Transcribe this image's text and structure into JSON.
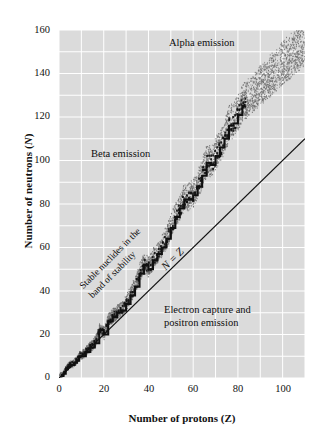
{
  "figure": {
    "background_color": "#ffffff",
    "plot_background_color": "#dbdbdb",
    "gridline_color": "#ffffff",
    "axis_color": "#111111",
    "stable_line_color": "#111111",
    "nz_line_color": "#111111",
    "band_stipple_color": "#6b6b6b"
  },
  "axes": {
    "x_title": "Number of protons (Z)",
    "y_title_prefix": "Number of neutrons (",
    "y_title_symbol": "N",
    "y_title_suffix": ")",
    "x_ticks": [
      "0",
      "20",
      "40",
      "60",
      "80",
      "100"
    ],
    "y_ticks": [
      "0",
      "20",
      "40",
      "60",
      "80",
      "100",
      "120",
      "140",
      "160"
    ]
  },
  "annotations": {
    "alpha": "Alpha emission",
    "beta": "Beta emission",
    "electron_capture_line1": "Electron capture and",
    "electron_capture_line2": "positron emission",
    "stable_line1": "Stable nuclides in the",
    "stable_line2": "band of stability",
    "nz_line": "N = Z"
  },
  "chart_data": {
    "type": "scatter",
    "title": "",
    "xlabel": "Number of protons (Z)",
    "ylabel": "Number of neutrons (N)",
    "xlim": [
      0,
      110
    ],
    "ylim": [
      0,
      160
    ],
    "x_ticks": [
      0,
      20,
      40,
      60,
      80,
      100
    ],
    "y_ticks": [
      0,
      20,
      40,
      60,
      80,
      100,
      120,
      140,
      160
    ],
    "grid": true,
    "grid_step_x": 10,
    "grid_step_y": 10,
    "legend": "none",
    "series": [
      {
        "name": "N = Z reference line",
        "type": "line",
        "x": [
          0,
          110
        ],
        "values": [
          0,
          110
        ],
        "style": "solid-thick-black"
      },
      {
        "name": "Stable nuclides (band of stability)",
        "type": "step-scatter",
        "style": "dark-square-markers",
        "x": [
          1,
          2,
          3,
          4,
          5,
          6,
          7,
          8,
          9,
          10,
          12,
          14,
          16,
          18,
          20,
          22,
          24,
          26,
          28,
          30,
          32,
          34,
          36,
          38,
          40,
          42,
          44,
          46,
          48,
          50,
          52,
          54,
          56,
          58,
          60,
          62,
          64,
          66,
          68,
          70,
          72,
          74,
          76,
          78,
          80,
          82,
          83
        ],
        "values": [
          1,
          2,
          4,
          5,
          6,
          6,
          7,
          8,
          10,
          10,
          12,
          14,
          16,
          22,
          20,
          26,
          28,
          30,
          31,
          34,
          38,
          42,
          48,
          52,
          50,
          54,
          57,
          60,
          64,
          69,
          74,
          78,
          82,
          82,
          84,
          88,
          93,
          99,
          98,
          102,
          106,
          110,
          116,
          117,
          121,
          125,
          126
        ],
        "note": "Dark stepped band of stable isotopes curving above N = Z"
      },
      {
        "name": "Nuclide stipple cloud (known nuclides)",
        "type": "stipple-band",
        "style": "gray-dots",
        "note": "Dotted cloud of unstable nuclides hugging the stable band, widening at high Z; reaches roughly Z=110, N=157 at top right",
        "band_lower_offset": -6,
        "band_upper_offset": 10
      }
    ]
  }
}
